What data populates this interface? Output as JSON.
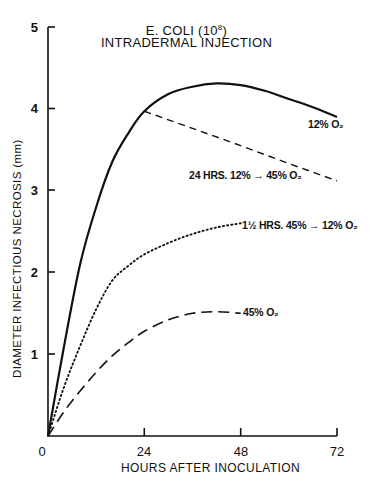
{
  "chart_data": {
    "type": "line",
    "subtitle": "INTRADERMAL INJECTION",
    "xlabel": "HOURS AFTER INOCULATION",
    "ylabel": "DIAMETER INFECTIOUS NECROSIS (mm)",
    "xlim": [
      0,
      72
    ],
    "ylim": [
      0,
      5
    ],
    "x_ticks": [
      "0",
      "24",
      "48",
      "72"
    ],
    "y_ticks": [
      "0",
      "1",
      "2",
      "3",
      "4",
      "5"
    ],
    "grid": false,
    "legend_position": "inline labels at curve ends",
    "series": [
      {
        "name": "12% O₂",
        "style": "solid",
        "x": [
          0,
          4,
          8,
          12,
          16,
          20,
          24,
          30,
          36,
          42,
          48,
          54,
          60,
          66,
          72
        ],
        "y": [
          0,
          1.1,
          2.1,
          2.8,
          3.35,
          3.7,
          3.97,
          4.18,
          4.27,
          4.31,
          4.29,
          4.22,
          4.12,
          4.02,
          3.9
        ]
      },
      {
        "name": "24 HRS. 12% → 45% O₂",
        "style": "dashed",
        "x": [
          0,
          4,
          8,
          12,
          16,
          20,
          24,
          36,
          48,
          60,
          72
        ],
        "y": [
          0,
          1.1,
          2.1,
          2.8,
          3.35,
          3.7,
          3.97,
          3.76,
          3.55,
          3.33,
          3.12
        ]
      },
      {
        "name": "1½ HRS. 45% → 12% O₂",
        "style": "dotted",
        "x": [
          0,
          4,
          8,
          12,
          16,
          20,
          24,
          30,
          36,
          42,
          48
        ],
        "y": [
          0,
          0.6,
          1.1,
          1.55,
          1.9,
          2.08,
          2.22,
          2.36,
          2.47,
          2.55,
          2.6
        ]
      },
      {
        "name": "45% O₂",
        "style": "long-dashed",
        "x": [
          0,
          4,
          8,
          12,
          16,
          20,
          24,
          30,
          36,
          42,
          48
        ],
        "y": [
          0,
          0.3,
          0.55,
          0.78,
          0.98,
          1.14,
          1.28,
          1.42,
          1.5,
          1.52,
          1.5
        ]
      }
    ],
    "annotations": [
      "12% O₂",
      "24 HRS. 12% → 45% O₂",
      "1½ HRS. 45% → 12% O₂",
      "45% O₂"
    ]
  },
  "labels": {
    "title_line1": "E. COLI (10",
    "title_sup": "8",
    "title_close": ")",
    "title_line2": "INTRADERMAL INJECTION",
    "xlabel": "HOURS AFTER INOCULATION",
    "ylabel": "DIAMETER INFECTIOUS NECROSIS (mm)",
    "x_ticks": [
      "0",
      "24",
      "48",
      "72"
    ],
    "y_ticks": [
      "1",
      "2",
      "3",
      "4",
      "5"
    ],
    "curve_12": "12% O₂",
    "curve_24h": "24 HRS. 12% → 45% O₂",
    "curve_1_5h": "1½ HRS. 45% → 12% O₂",
    "curve_45": "45% O₂"
  }
}
